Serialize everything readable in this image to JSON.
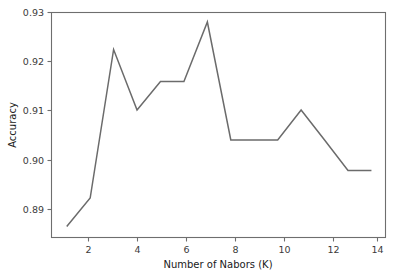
{
  "chart_data": {
    "type": "line",
    "title": "",
    "xlabel": "Number of Nabors (K)",
    "ylabel": "Accuracy",
    "x": [
      1,
      2,
      3,
      4,
      5,
      6,
      7,
      8,
      9,
      10,
      11,
      12,
      13,
      14
    ],
    "values": [
      0.8877,
      0.8934,
      0.9231,
      0.911,
      0.9167,
      0.9167,
      0.9286,
      0.905,
      0.905,
      0.905,
      0.911,
      0.905,
      0.8989,
      0.8989
    ],
    "series": [
      {
        "name": "Accuracy",
        "values": [
          0.8877,
          0.8934,
          0.9231,
          0.911,
          0.9167,
          0.9167,
          0.9286,
          0.905,
          0.905,
          0.905,
          0.911,
          0.905,
          0.8989,
          0.8989
        ],
        "color": "#6b6b6b"
      }
    ],
    "xlim": [
      0.35,
      14.6
    ],
    "ylim": [
      0.8855,
      0.9305
    ],
    "xticks": [
      2,
      4,
      6,
      8,
      10,
      12,
      14
    ],
    "xtick_labels": [
      "2",
      "4",
      "6",
      "8",
      "10",
      "12",
      "14"
    ],
    "yticks": [
      0.89,
      0.9,
      0.91,
      0.92,
      0.93
    ],
    "ytick_labels": [
      "0.89",
      "0.90",
      "0.91",
      "0.92",
      "0.93"
    ],
    "grid": false,
    "legend": false,
    "legend_position": "none",
    "background_color": "#ffffff",
    "axis_color": "#6e6e6e"
  },
  "axes": {
    "x_title": "Number of Nabors (K)",
    "y_title": "Accuracy"
  }
}
